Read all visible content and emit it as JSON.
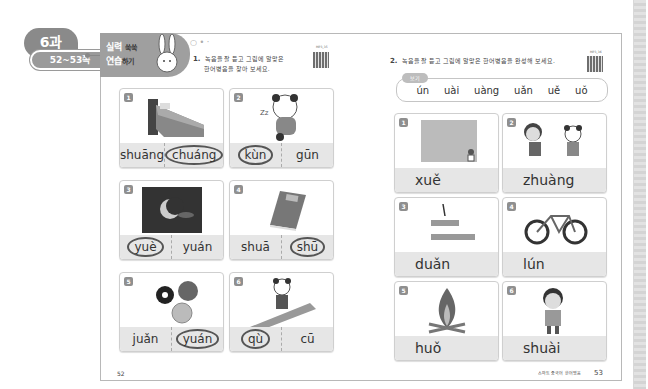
{
  "lesson_badge": {
    "lesson": "6과",
    "pages": "52~53쪽"
  },
  "section_title": {
    "line1": "실력",
    "line1_small": "쑥쑥",
    "line2": "연습",
    "line2_small": "하기"
  },
  "exercise1": {
    "number": "1.",
    "instruction_line1": "녹음을 잘 듣고 그림에 알맞은",
    "instruction_line2": "한어병음을 찾아 보세요.",
    "qr_label": "MP3_35",
    "items": [
      {
        "num": "1",
        "picture": "bed",
        "options": [
          "shuāng",
          "chuáng"
        ],
        "circled": 1
      },
      {
        "num": "2",
        "picture": "sleepy-panda",
        "options": [
          "kùn",
          "gūn"
        ],
        "circled": 0
      },
      {
        "num": "3",
        "picture": "moon-night",
        "options": [
          "yuè",
          "yuán"
        ],
        "circled": 0
      },
      {
        "num": "4",
        "picture": "book",
        "options": [
          "shuā",
          "shū"
        ],
        "circled": 1
      },
      {
        "num": "5",
        "picture": "round-objects",
        "options": [
          "juǎn",
          "yuán"
        ],
        "circled": 1
      },
      {
        "num": "6",
        "picture": "panda-walking",
        "options": [
          "qù",
          "cū"
        ],
        "circled": 0
      }
    ]
  },
  "exercise2": {
    "number": "2.",
    "instruction": "녹음을 잘 듣고 그림에 알맞은 한어병음을 완성해 보세요.",
    "qr_label": "MP3_36",
    "bogi_label": "보기",
    "bogi_options": [
      "ún",
      "uài",
      "uàng",
      "uǎn",
      "uě",
      "uǒ"
    ],
    "items": [
      {
        "num": "1",
        "picture": "snow",
        "answer": "xuě"
      },
      {
        "num": "2",
        "picture": "bump",
        "answer": "zhuàng"
      },
      {
        "num": "3",
        "picture": "short-pencil",
        "answer": "duǎn"
      },
      {
        "num": "4",
        "picture": "bicycle-wheel",
        "answer": "lún"
      },
      {
        "num": "5",
        "picture": "fire",
        "answer": "huǒ"
      },
      {
        "num": "6",
        "picture": "handsome-boy",
        "answer": "shuài"
      }
    ]
  },
  "footer": {
    "left_page": "52",
    "right_caption": "스마트 중국어 한어병음",
    "right_page": "53"
  }
}
